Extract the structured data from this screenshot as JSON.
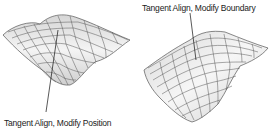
{
  "figure": {
    "left_surface": {
      "label": "Tangent Align, Modify Position"
    },
    "right_surface": {
      "label": "Tangent Align, Modify Boundary"
    }
  },
  "colors": {
    "surface_fill": "#ececec",
    "surface_shade": "#c8c8c8",
    "grid_line": "#444444",
    "leader_line": "#111111",
    "text": "#222222"
  }
}
